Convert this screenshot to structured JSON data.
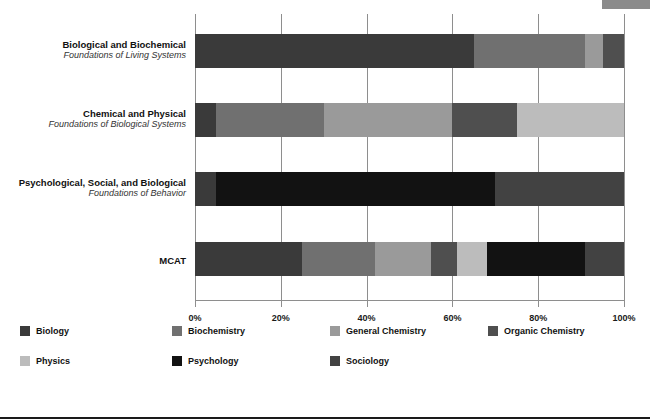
{
  "chart_data": {
    "type": "bar",
    "orientation": "horizontal",
    "stacked": true,
    "title": "",
    "xlabel": "",
    "ylabel": "",
    "xlim": [
      0,
      100
    ],
    "xticks": [
      "0%",
      "20%",
      "40%",
      "60%",
      "80%",
      "100%"
    ],
    "xtick_values": [
      0,
      20,
      40,
      60,
      80,
      100
    ],
    "grid": true,
    "legend_position": "bottom",
    "categories": [
      {
        "main": "Biological and Biochemical",
        "sub": "Foundations of Living Systems"
      },
      {
        "main": "Chemical and Physical",
        "sub": "Foundations of Biological Systems"
      },
      {
        "main": "Psychological, Social, and Biological",
        "sub": "Foundations of Behavior"
      },
      {
        "main": "MCAT",
        "sub": ""
      }
    ],
    "series": [
      {
        "name": "Biology",
        "color": "#3a3a3a",
        "values": [
          65,
          5,
          5,
          25
        ]
      },
      {
        "name": "Biochemistry",
        "color": "#707070",
        "values": [
          26,
          25,
          0,
          17
        ]
      },
      {
        "name": "General Chemistry",
        "color": "#9a9a9a",
        "values": [
          4,
          30,
          0,
          13
        ]
      },
      {
        "name": "Organic Chemistry",
        "color": "#4f4f4f",
        "values": [
          5,
          15,
          0,
          6
        ]
      },
      {
        "name": "Physics",
        "color": "#bcbcbc",
        "values": [
          0,
          25,
          0,
          7
        ]
      },
      {
        "name": "Psychology",
        "color": "#121212",
        "values": [
          0,
          0,
          65,
          23
        ]
      },
      {
        "name": "Sociology",
        "color": "#424242",
        "values": [
          0,
          0,
          30,
          9
        ]
      }
    ],
    "legend": [
      {
        "label": "Biology",
        "color": "#3a3a3a"
      },
      {
        "label": "Biochemistry",
        "color": "#707070"
      },
      {
        "label": "General Chemistry",
        "color": "#9a9a9a"
      },
      {
        "label": "Organic Chemistry",
        "color": "#4f4f4f"
      },
      {
        "label": "Physics",
        "color": "#bcbcbc"
      },
      {
        "label": "Psychology",
        "color": "#121212"
      },
      {
        "label": "Sociology",
        "color": "#424242"
      }
    ]
  },
  "colors": {
    "grid": "#8e8e8e",
    "text": "#111111",
    "rule": "#1a1a1a",
    "corner_tab": "#8b8b8b"
  }
}
